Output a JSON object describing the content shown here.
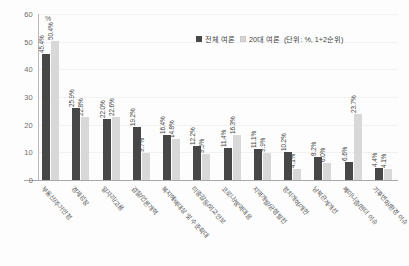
{
  "chart_data": {
    "type": "bar",
    "title": "",
    "xlabel": "",
    "ylabel": "%",
    "unit_label": "%",
    "ylim": [
      0,
      60
    ],
    "yticks": [
      0,
      10,
      20,
      30,
      40,
      50,
      60
    ],
    "grid": true,
    "legend_position": "top-right",
    "legend_note": "(단위: %, 1+2순위)",
    "categories": [
      "부동산/주거안정",
      "경제성장",
      "일자리/고용",
      "검찰/언론개혁",
      "복지혜택대상 및 수준확대",
      "미중갈등/외교안보",
      "코로나/방역대응",
      "지역개발/균형발전",
      "정치개혁/개헌",
      "남북관계개선",
      "페미니즘/젠더 이슈",
      "기후변화/환경 이슈"
    ],
    "series": [
      {
        "name": "전체 여론",
        "color": "#474747",
        "values": [
          45.4,
          25.9,
          22.0,
          19.2,
          16.4,
          12.2,
          11.4,
          11.1,
          10.2,
          8.2,
          6.6,
          4.4
        ],
        "labels": [
          "45.4%",
          "25.9%",
          "22.0%",
          "19.2%",
          "16.4%",
          "12.2%",
          "11.4%",
          "11.1%",
          "10.2%",
          "8.2%",
          "6.6%",
          "4.4%"
        ]
      },
      {
        "name": "20대 여론",
        "color": "#d8d8d8",
        "values": [
          50.4,
          22.8,
          22.6,
          9.7,
          14.8,
          9.5,
          16.3,
          9.9,
          4.1,
          6.0,
          23.7,
          4.1
        ],
        "labels": [
          "50.4%",
          "22.8%",
          "22.6%",
          "9.7%",
          "14.8%",
          "9.5%",
          "16.3%",
          "9.9%",
          "4.1%",
          "6.0%",
          "23.7%",
          "4.1%"
        ]
      }
    ]
  },
  "axis": {
    "tick_0": "0",
    "tick_10": "10",
    "tick_20": "20",
    "tick_30": "30",
    "tick_40": "40",
    "tick_50": "50",
    "tick_60": "60"
  }
}
